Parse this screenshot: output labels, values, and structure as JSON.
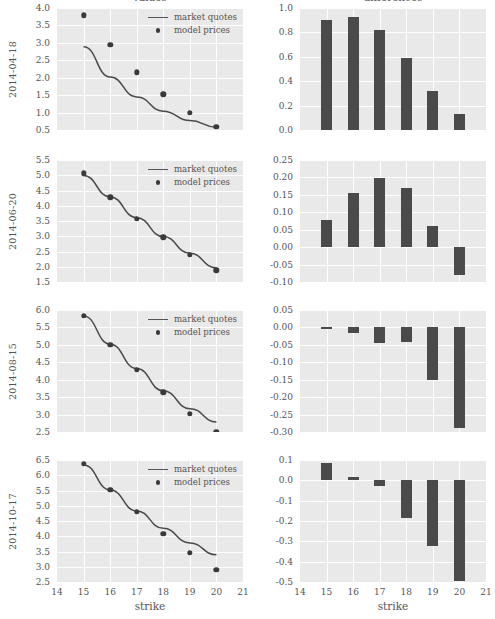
{
  "figure": {
    "column_titles": [
      "values",
      "differences"
    ],
    "xlabel": "strike",
    "legend": {
      "line_label": "market quotes",
      "dot_label": "model prices"
    },
    "colors": {
      "panel_background": "#E9E9E9",
      "grid": "#FFFFFF",
      "marker": "#3A3A3A",
      "bar": "#4A4A4A",
      "text": "#555555"
    }
  },
  "chart_data": [
    {
      "type": "line",
      "title": "values",
      "row_label": "2014-04-18",
      "xlabel": "strike",
      "ylabel": "2014-04-18",
      "xlim": [
        14,
        21
      ],
      "ylim": [
        0.5,
        4.0
      ],
      "xticks": [
        14,
        15,
        16,
        17,
        18,
        19,
        20,
        21
      ],
      "yticks": [
        0.5,
        1.0,
        1.5,
        2.0,
        2.5,
        3.0,
        3.5,
        4.0
      ],
      "grid": true,
      "legend": [
        "market quotes",
        "model prices"
      ],
      "legend_position": "upper right",
      "x": [
        15,
        16,
        17,
        18,
        19,
        20
      ],
      "series": [
        {
          "name": "market quotes",
          "type": "line",
          "values": [
            2.89,
            2.02,
            1.45,
            1.04,
            0.77,
            0.58
          ]
        },
        {
          "name": "model prices",
          "type": "scatter",
          "values": [
            3.79,
            2.94,
            2.16,
            1.52,
            1.0,
            0.6
          ]
        }
      ]
    },
    {
      "type": "bar",
      "title": "differences",
      "row_label": "2014-04-18",
      "xlabel": "strike",
      "xlim": [
        14,
        21
      ],
      "ylim": [
        0.0,
        1.0
      ],
      "xticks": [
        14,
        15,
        16,
        17,
        18,
        19,
        20,
        21
      ],
      "yticks": [
        0.0,
        0.2,
        0.4,
        0.6,
        0.8,
        1.0
      ],
      "grid": true,
      "categories": [
        15,
        16,
        17,
        18,
        19,
        20
      ],
      "values": [
        0.9,
        0.93,
        0.82,
        0.59,
        0.32,
        0.13
      ]
    },
    {
      "type": "line",
      "title": "values",
      "row_label": "2014-06-20",
      "xlabel": "strike",
      "ylabel": "2014-06-20",
      "xlim": [
        14,
        21
      ],
      "ylim": [
        1.5,
        5.5
      ],
      "xticks": [
        14,
        15,
        16,
        17,
        18,
        19,
        20,
        21
      ],
      "yticks": [
        1.5,
        2.0,
        2.5,
        3.0,
        3.5,
        4.0,
        4.5,
        5.0,
        5.5
      ],
      "grid": true,
      "legend": [
        "market quotes",
        "model prices"
      ],
      "legend_position": "upper right",
      "x": [
        15,
        16,
        17,
        18,
        19,
        20
      ],
      "series": [
        {
          "name": "market quotes",
          "type": "line",
          "values": [
            4.99,
            4.29,
            3.61,
            2.99,
            2.44,
            1.96
          ]
        },
        {
          "name": "model prices",
          "type": "scatter",
          "values": [
            5.06,
            4.28,
            3.57,
            2.96,
            2.4,
            1.88
          ]
        }
      ]
    },
    {
      "type": "bar",
      "title": "differences",
      "row_label": "2014-06-20",
      "xlabel": "strike",
      "xlim": [
        14,
        21
      ],
      "ylim": [
        -0.1,
        0.25
      ],
      "xticks": [
        14,
        15,
        16,
        17,
        18,
        19,
        20,
        21
      ],
      "yticks": [
        -0.1,
        -0.05,
        0.0,
        0.05,
        0.1,
        0.15,
        0.2,
        0.25
      ],
      "grid": true,
      "categories": [
        15,
        16,
        17,
        18,
        19,
        20
      ],
      "values": [
        0.077,
        0.155,
        0.198,
        0.17,
        0.06,
        -0.08
      ]
    },
    {
      "type": "line",
      "title": "values",
      "row_label": "2014-08-15",
      "xlabel": "strike",
      "ylabel": "2014-08-15",
      "xlim": [
        14,
        21
      ],
      "ylim": [
        2.5,
        6.0
      ],
      "xticks": [
        14,
        15,
        16,
        17,
        18,
        19,
        20,
        21
      ],
      "yticks": [
        2.5,
        3.0,
        3.5,
        4.0,
        4.5,
        5.0,
        5.5,
        6.0
      ],
      "grid": true,
      "legend": [
        "market quotes",
        "model prices"
      ],
      "legend_position": "upper right",
      "x": [
        15,
        16,
        17,
        18,
        19,
        20
      ],
      "series": [
        {
          "name": "market quotes",
          "type": "line",
          "values": [
            5.83,
            5.02,
            4.32,
            3.68,
            3.17,
            2.79
          ]
        },
        {
          "name": "model prices",
          "type": "scatter",
          "values": [
            5.83,
            5.01,
            4.29,
            3.64,
            3.02,
            2.51
          ]
        }
      ]
    },
    {
      "type": "bar",
      "title": "differences",
      "row_label": "2014-08-15",
      "xlabel": "strike",
      "xlim": [
        14,
        21
      ],
      "ylim": [
        -0.3,
        0.05
      ],
      "xticks": [
        14,
        15,
        16,
        17,
        18,
        19,
        20,
        21
      ],
      "yticks": [
        -0.3,
        -0.25,
        -0.2,
        -0.15,
        -0.1,
        -0.05,
        0.0,
        0.05
      ],
      "grid": true,
      "categories": [
        15,
        16,
        17,
        18,
        19,
        20
      ],
      "values": [
        -0.004,
        -0.015,
        -0.045,
        -0.042,
        -0.152,
        -0.288
      ]
    },
    {
      "type": "line",
      "title": "values",
      "row_label": "2014-10-17",
      "xlabel": "strike",
      "ylabel": "2014-10-17",
      "xlim": [
        14,
        21
      ],
      "ylim": [
        2.5,
        6.5
      ],
      "xticks": [
        14,
        15,
        16,
        17,
        18,
        19,
        20,
        21
      ],
      "yticks": [
        2.5,
        3.0,
        3.5,
        4.0,
        4.5,
        5.0,
        5.5,
        6.0,
        6.5
      ],
      "grid": true,
      "legend": [
        "market quotes",
        "model prices"
      ],
      "legend_position": "upper right",
      "x": [
        15,
        16,
        17,
        18,
        19,
        20
      ],
      "series": [
        {
          "name": "market quotes",
          "type": "line",
          "values": [
            6.34,
            5.52,
            4.83,
            4.26,
            3.78,
            3.39
          ]
        },
        {
          "name": "model prices",
          "type": "scatter",
          "values": [
            6.38,
            5.53,
            4.8,
            4.09,
            3.45,
            2.89
          ]
        }
      ]
    },
    {
      "type": "bar",
      "title": "differences",
      "row_label": "2014-10-17",
      "xlabel": "strike",
      "xlim": [
        14,
        21
      ],
      "ylim": [
        -0.5,
        0.1
      ],
      "xticks": [
        14,
        15,
        16,
        17,
        18,
        19,
        20,
        21
      ],
      "yticks": [
        -0.5,
        -0.4,
        -0.3,
        -0.2,
        -0.1,
        0.0,
        0.1
      ],
      "grid": true,
      "categories": [
        15,
        16,
        17,
        18,
        19,
        20
      ],
      "values": [
        0.085,
        0.015,
        -0.028,
        -0.183,
        -0.322,
        -0.495
      ]
    }
  ]
}
